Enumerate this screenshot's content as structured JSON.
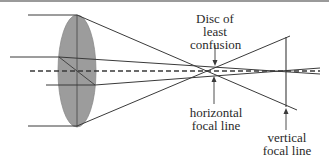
{
  "diagram": {
    "colors": {
      "lens_fill": "#9c9c9c",
      "line": "#3a3a3a",
      "axis": "#3a3a3a",
      "text": "#2a2a2a",
      "background": "#ffffff"
    },
    "labels": {
      "disc": [
        "Disc of",
        "least",
        "confusion"
      ],
      "horizontal": [
        "horizontal",
        "focal line"
      ],
      "vertical": [
        "vertical",
        "focal line"
      ]
    }
  }
}
